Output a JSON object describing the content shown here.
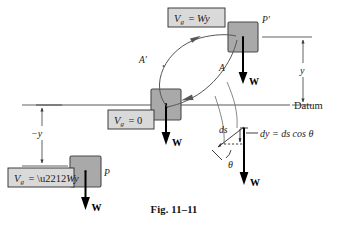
{
  "figure": {
    "caption": "Fig. 11–11",
    "datum_label": "Datum",
    "background_color": "#ffffff",
    "block_fill": "#a9a9a9",
    "label_box_fill": "#d9d9d9",
    "curve_color": "#55565a",
    "line_color": "#3a3a3a"
  },
  "potential_labels": [
    {
      "id": "vg-positive",
      "text": "V  = Wy",
      "var": "V",
      "sub": "g",
      "rhs": "= Wy",
      "full": "V_g = Wy"
    },
    {
      "id": "vg-zero",
      "text": "V  = 0",
      "var": "V",
      "sub": "g",
      "rhs": "= 0",
      "full": "V_g = 0"
    },
    {
      "id": "vg-negative",
      "text": "V  = −Wy",
      "var": "V",
      "sub": "g",
      "rhs": "= −Wy",
      "full": "V_g = −Wy"
    }
  ],
  "blocks": [
    {
      "id": "block-upper",
      "point_label": "P′",
      "weight_label": "W"
    },
    {
      "id": "block-datum",
      "point_label": "",
      "weight_label": "W"
    },
    {
      "id": "block-lower",
      "point_label": "P",
      "weight_label": "W"
    }
  ],
  "path_labels": [
    {
      "id": "path-up",
      "text": "A′"
    },
    {
      "id": "path-down",
      "text": "A"
    }
  ],
  "dimensions": [
    {
      "id": "dim-above-datum",
      "text": "y"
    },
    {
      "id": "dim-below-datum",
      "text": "−y"
    }
  ],
  "detail": {
    "ds_label": "ds",
    "dy_equation": "dy = ds cos θ",
    "theta_label": "θ",
    "weight_label": "W"
  }
}
